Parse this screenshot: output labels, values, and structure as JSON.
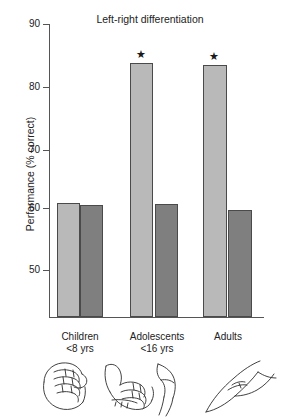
{
  "chart_data": {
    "type": "bar",
    "title": "Left-right differentiation",
    "xlabel": "",
    "ylabel": "Performance (% correct)",
    "ylim": [
      45,
      90
    ],
    "yticks": [
      50,
      60,
      70,
      80,
      90
    ],
    "ytick_labels": [
      "50",
      "60",
      "70",
      "80",
      "90"
    ],
    "grid": false,
    "legend": "none",
    "categories": [
      "Children",
      "Adolescents",
      "Adults"
    ],
    "category_sublabels": [
      "<8 yrs",
      "<16 yrs",
      ""
    ],
    "series": [
      {
        "name": "light-bar",
        "values": [
          60.9,
          83.6,
          83.4
        ]
      },
      {
        "name": "dark-bar",
        "values": [
          60.6,
          60.8,
          59.8
        ]
      }
    ],
    "annotations": [
      {
        "label": "★",
        "category": "Adolescents",
        "series": "light-bar"
      },
      {
        "label": "★",
        "category": "Adults",
        "series": "light-bar"
      }
    ],
    "colors": {
      "light": "#b9b9b9",
      "dark": "#7f7f7f",
      "outline": "#4a4a4a",
      "axis": "#555555",
      "text": "#222222"
    }
  },
  "figure": {
    "title": "Left-right differentiation",
    "y_axis_label": "Performance (% correct)",
    "tick_labels": [
      "90",
      "80",
      "70",
      "60",
      "50"
    ],
    "groups": [
      {
        "name": "Children",
        "sub": "<8 yrs",
        "star": ""
      },
      {
        "name": "Adolescents",
        "sub": "<16 yrs",
        "star": "★"
      },
      {
        "name": "Adults",
        "sub": "",
        "star": "★"
      }
    ],
    "star_symbol": "★",
    "hand_caption": ""
  }
}
